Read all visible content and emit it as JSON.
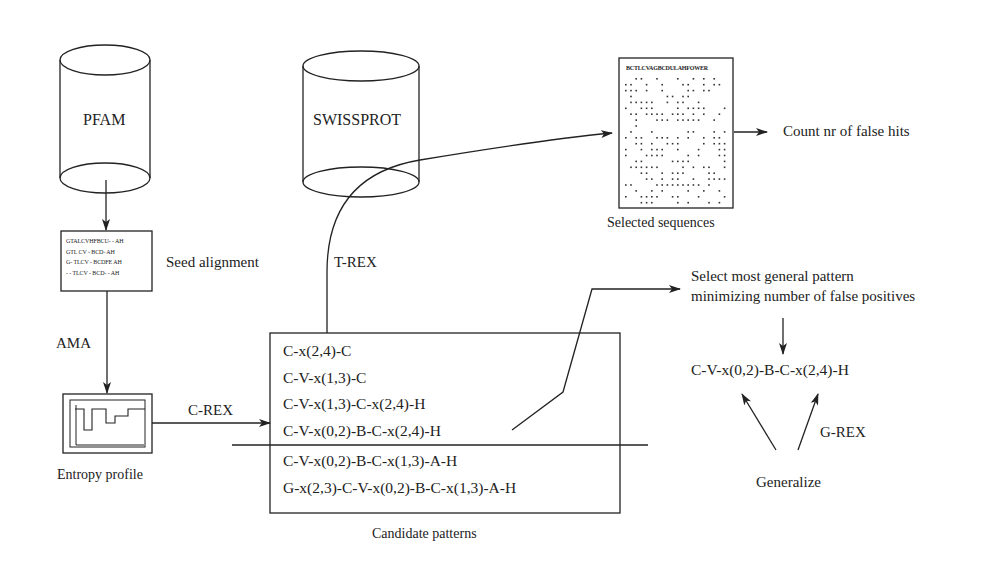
{
  "diagram": {
    "databases": {
      "pfam": {
        "label": "PFAM"
      },
      "swissprot": {
        "label": "SWISSPROT"
      }
    },
    "seed_alignment": {
      "label": "Seed alignment",
      "rows": [
        "GTALCVHFBCU- - AH",
        "GTL CV - BCD- AH",
        "G- TLCV - BCDFE AH",
        "- - TLCV - BCD- - AH"
      ]
    },
    "steps": {
      "ama": "AMA",
      "entropy_profile": "Entropy profile",
      "c_rex": "C-REX",
      "t_rex": "T-REX",
      "g_rex": "G-REX",
      "generalize": "Generalize"
    },
    "candidate_patterns": {
      "label": "Candidate patterns",
      "above_threshold": [
        "C-x(2,4)-C",
        "C-V-x(1,3)-C",
        "C-V-x(1,3)-C-x(2,4)-H",
        "C-V-x(0,2)-B-C-x(2,4)-H"
      ],
      "below_threshold": [
        "C-V-x(0,2)-B-C-x(1,3)-A-H",
        "G-x(2,3)-C-V-x(0,2)-B-C-x(1,3)-A-H"
      ]
    },
    "selected_sequences": {
      "label": "Selected sequences",
      "header": "BCTLCVAGBCDULAHFOWER"
    },
    "count_label": "Count nr of false hits",
    "selection": {
      "line1": "Select most general pattern",
      "line2": "minimizing number of false positives"
    },
    "chosen_pattern": "C-V-x(0,2)-B-C-x(2,4)-H",
    "colors": {
      "ink": "#222222",
      "background": "#ffffff"
    }
  }
}
